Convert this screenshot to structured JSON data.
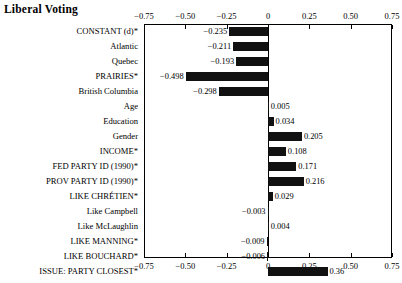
{
  "chart_data": {
    "type": "bar",
    "orientation": "horizontal",
    "title": "Liberal Voting",
    "xlabel": "",
    "ylabel": "",
    "xlim": [
      -0.75,
      0.75
    ],
    "grid": false,
    "legend": null,
    "zero_line": 0,
    "tick_labels": [
      "−0.75",
      "−0.50",
      "−0.25",
      "0",
      "0.25",
      "0.50",
      "0.75"
    ],
    "tick_values": [
      -0.75,
      -0.5,
      -0.25,
      0,
      0.25,
      0.5,
      0.75
    ],
    "bar_color": "#111111",
    "categories": [
      "CONSTANT (d)*",
      "Atlantic",
      "Quebec",
      "PRAIRIES*",
      "British Columbia",
      "Age",
      "Education",
      "Gender",
      "INCOME*",
      "FED PARTY ID (1990)*",
      "PROV PARTY ID (1990)*",
      "LIKE CHRÉTIEN*",
      "Like Campbell",
      "Like McLaughlin",
      "LIKE MANNING*",
      "LIKE BOUCHARD*",
      "ISSUE: PARTY CLOSEST*"
    ],
    "values": [
      -0.235,
      -0.211,
      -0.193,
      -0.498,
      -0.298,
      0.005,
      0.034,
      0.205,
      0.108,
      0.171,
      0.216,
      0.029,
      -0.003,
      0.004,
      -0.009,
      -0.006,
      0.36
    ],
    "value_labels": [
      "−0.235",
      "−0.211",
      "−0.193",
      "−0.498",
      "−0.298",
      "0.005",
      "0.034",
      "0.205",
      "0.108",
      "0.171",
      "0.216",
      "0.029",
      "−0.003",
      "0.004",
      "−0.009",
      "−0.006",
      "0.36"
    ]
  }
}
